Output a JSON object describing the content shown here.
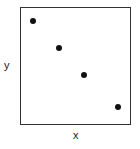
{
  "chart_data": {
    "type": "scatter",
    "title": "",
    "xlabel": "x",
    "ylabel": "y",
    "grid": false,
    "legend": null,
    "xlim": [
      0,
      10
    ],
    "ylim": [
      0,
      10
    ],
    "points": [
      {
        "x": 1.2,
        "y": 8.8
      },
      {
        "x": 3.5,
        "y": 6.5
      },
      {
        "x": 5.8,
        "y": 4.2
      },
      {
        "x": 8.8,
        "y": 1.5
      }
    ],
    "colors": {
      "points": "#111111",
      "frame": "#333333"
    }
  }
}
